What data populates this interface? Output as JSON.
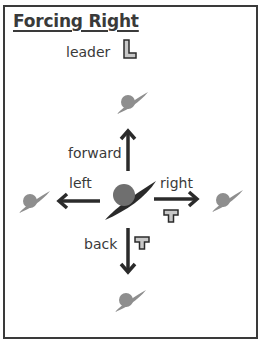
{
  "title": "Forcing Right",
  "legend": {
    "label": "leader",
    "symbol": "L"
  },
  "directions": {
    "forward": {
      "label": "forward"
    },
    "left": {
      "label": "left"
    },
    "right": {
      "label": "right",
      "marker": "T"
    },
    "back": {
      "label": "back",
      "marker": "T"
    }
  },
  "colors": {
    "frame": "#3a3a3a",
    "arrow": "#2b2b2b",
    "dancer_center": "#2a2a2a",
    "dancer_head": "#6f6f6f",
    "dancer_ghost": "#8e8e8e",
    "marker_fill": "#c8c8c8"
  }
}
